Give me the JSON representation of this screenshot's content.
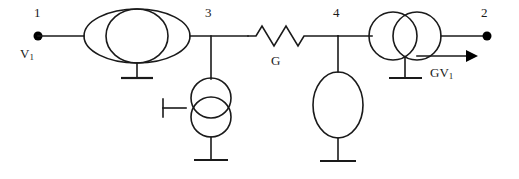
{
  "diagram": {
    "type": "electrical-schematic",
    "stroke_color": "#1a1a1a",
    "background_color": "#ffffff",
    "labels": {
      "node1": "1",
      "node2": "2",
      "node3": "3",
      "node4": "4",
      "source_voltage": "V",
      "source_voltage_sub": "1",
      "conductance": "G",
      "dependent_source": "GV",
      "dependent_source_sub": "1"
    },
    "components": [
      {
        "name": "input-voltage-source",
        "kind": "voltage-source-ellipse-pair",
        "label": "V1",
        "between": [
          "1",
          "3"
        ]
      },
      {
        "name": "shunt-current-source-node3",
        "kind": "current-source-double-circle-vertical",
        "between": [
          "3",
          "ground"
        ]
      },
      {
        "name": "series-conductance",
        "kind": "resistor",
        "label": "G",
        "between": [
          "3",
          "4"
        ]
      },
      {
        "name": "shunt-admittance-node4",
        "kind": "ellipse-element",
        "between": [
          "4",
          "ground"
        ]
      },
      {
        "name": "dependent-current-source",
        "kind": "current-source-double-circle-horizontal",
        "label": "GV1",
        "between": [
          "4",
          "2"
        ]
      }
    ],
    "nodes": [
      {
        "id": "1",
        "terminal": true
      },
      {
        "id": "2",
        "terminal": true
      },
      {
        "id": "3",
        "terminal": false
      },
      {
        "id": "4",
        "terminal": false
      }
    ],
    "grounds": 4,
    "current_arrow_direction": "right"
  }
}
